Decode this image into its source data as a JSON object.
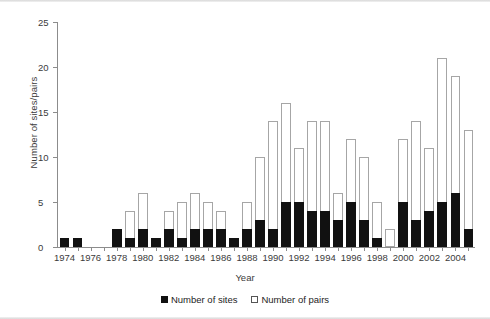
{
  "chart_data": {
    "type": "bar",
    "stacked": true,
    "title": "",
    "xlabel": "Year",
    "ylabel": "Number of sites/pairs",
    "ylim": [
      0,
      25
    ],
    "yticks": [
      0,
      5,
      10,
      15,
      20,
      25
    ],
    "grid": false,
    "legend_position": "bottom-center",
    "categories": [
      "1974",
      "1975",
      "1976",
      "1977",
      "1978",
      "1979",
      "1980",
      "1981",
      "1982",
      "1983",
      "1984",
      "1985",
      "1986",
      "1987",
      "1988",
      "1989",
      "1990",
      "1991",
      "1992",
      "1993",
      "1994",
      "1995",
      "1996",
      "1997",
      "1998",
      "1999",
      "2000",
      "2001",
      "2002",
      "2003",
      "2004",
      "2005"
    ],
    "xtick_labels": [
      "1974",
      "1976",
      "1978",
      "1980",
      "1982",
      "1984",
      "1986",
      "1988",
      "1990",
      "1992",
      "1994",
      "1996",
      "1998",
      "2000",
      "2002",
      "2004"
    ],
    "series": [
      {
        "name": "Number of sites",
        "color": "#111111",
        "values": [
          1,
          1,
          0,
          0,
          2,
          1,
          2,
          1,
          2,
          1,
          2,
          2,
          2,
          1,
          2,
          3,
          2,
          5,
          5,
          4,
          4,
          3,
          5,
          3,
          1,
          0,
          5,
          3,
          4,
          5,
          6,
          2
        ]
      },
      {
        "name": "Number of pairs",
        "color": "#ffffff",
        "values": [
          1,
          1,
          0,
          0,
          2,
          4,
          6,
          1,
          4,
          5,
          6,
          5,
          4,
          1,
          5,
          10,
          14,
          16,
          11,
          14,
          14,
          6,
          12,
          10,
          5,
          2,
          12,
          14,
          11,
          21,
          19,
          13
        ]
      }
    ]
  },
  "legend": {
    "items": [
      {
        "label": "Number of sites",
        "swatch": "filled-square-icon"
      },
      {
        "label": "Number of pairs",
        "swatch": "hollow-square-icon"
      }
    ]
  }
}
